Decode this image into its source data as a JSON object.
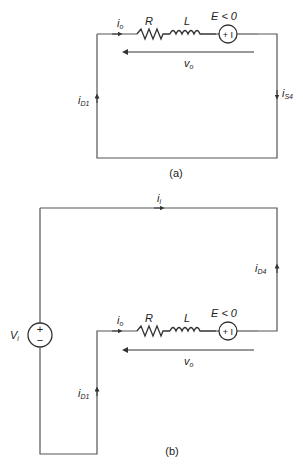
{
  "figure_a": {
    "caption": "(a)",
    "labels": {
      "io": "i",
      "io_sub": "o",
      "R": "R",
      "L": "L",
      "E": "E < 0",
      "E_symbol": "+ I",
      "vo": "v",
      "vo_sub": "o",
      "iD1": "i",
      "iD1_sub": "D1",
      "iS4": "i",
      "iS4_sub": "S4"
    }
  },
  "figure_b": {
    "caption": "(b)",
    "labels": {
      "ii": "i",
      "ii_sub": "i",
      "iD4": "i",
      "iD4_sub": "D4",
      "Vi": "V",
      "Vi_sub": "i",
      "Vi_plus": "+",
      "Vi_minus": "−",
      "io": "i",
      "io_sub": "o",
      "R": "R",
      "L": "L",
      "E": "E < 0",
      "E_symbol": "+ I",
      "vo": "v",
      "vo_sub": "o",
      "iD1": "i",
      "iD1_sub": "D1"
    }
  },
  "colors": {
    "wire": "#555555",
    "text": "#222222"
  }
}
